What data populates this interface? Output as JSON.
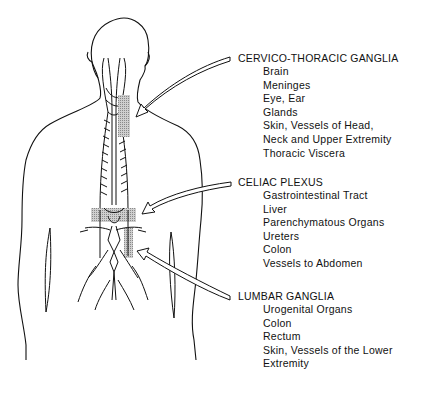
{
  "figure": {
    "callouts": [
      {
        "title": "CERVICO-THORACIC GANGLIA",
        "items": [
          "Brain",
          "Meninges",
          "Eye, Ear",
          "Glands",
          "Skin, Vessels of Head,",
          "Neck and Upper Extremity",
          "Thoracic Viscera"
        ]
      },
      {
        "title": "CELIAC PLEXUS",
        "items": [
          "Gastrointestinal Tract",
          "Liver",
          "Parenchymatous Organs",
          "Ureters",
          "Colon",
          "Vessels to Abdomen"
        ]
      },
      {
        "title": "LUMBAR GANGLIA",
        "items": [
          "Urogenital Organs",
          "Colon",
          "Rectum",
          "Skin, Vessels of the Lower",
          "Extremity"
        ]
      }
    ]
  }
}
